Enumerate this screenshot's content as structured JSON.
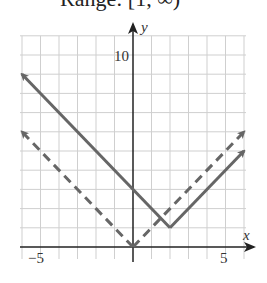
{
  "header": {
    "range_text": "Range: [1, ∞)"
  },
  "chart_data": {
    "type": "line",
    "title": "",
    "xlabel": "x",
    "ylabel": "y",
    "xlim": [
      -6,
      6
    ],
    "ylim": [
      0,
      11
    ],
    "grid": true,
    "x_tick_labels": [
      "−5",
      "5"
    ],
    "y_tick_labels": [
      "10"
    ],
    "series": [
      {
        "name": "y = |x − 2| + 1",
        "style": "solid",
        "color": "#666666",
        "points": [
          [
            -6,
            9
          ],
          [
            2,
            1
          ],
          [
            6,
            5
          ]
        ]
      },
      {
        "name": "y = |x|",
        "style": "dashed",
        "color": "#666666",
        "points": [
          [
            -6,
            6
          ],
          [
            0,
            0
          ],
          [
            6,
            6
          ]
        ]
      }
    ]
  }
}
